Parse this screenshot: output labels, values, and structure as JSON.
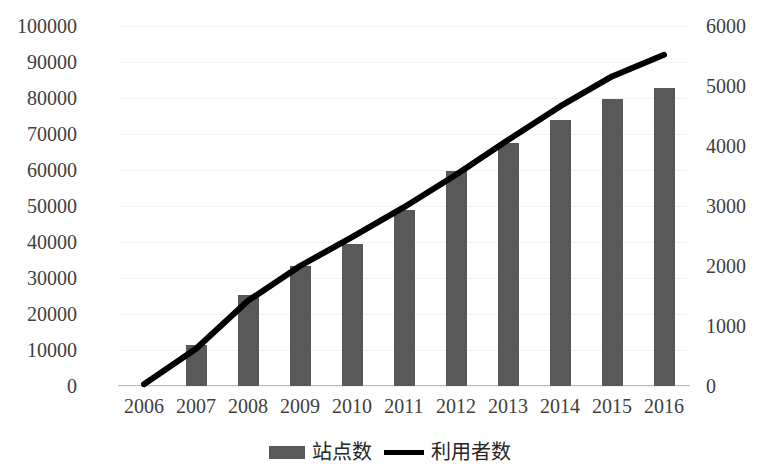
{
  "chart_data": {
    "type": "bar",
    "title": "",
    "subtitle": "",
    "xlabel": "",
    "ylabel": "",
    "grid": true,
    "legend_position": "bottom",
    "categories": [
      "2006",
      "2007",
      "2008",
      "2009",
      "2010",
      "2011",
      "2012",
      "2013",
      "2014",
      "2015",
      "2016"
    ],
    "axes": {
      "left": {
        "label": "",
        "min": 0,
        "max": 100000,
        "step": 10000,
        "ticks": [
          "0",
          "10000",
          "20000",
          "30000",
          "40000",
          "50000",
          "60000",
          "70000",
          "80000",
          "90000",
          "100000"
        ]
      },
      "right": {
        "label": "",
        "min": 0,
        "max": 6000,
        "step": 1000,
        "ticks": [
          "0",
          "1000",
          "2000",
          "3000",
          "4000",
          "5000",
          "6000"
        ]
      }
    },
    "series": [
      {
        "name": "站点数",
        "type": "bar",
        "axis": "left",
        "color": "#595959",
        "values": [
          0,
          11400,
          25300,
          33200,
          39500,
          48900,
          59600,
          67400,
          73900,
          79600,
          82900
        ]
      },
      {
        "name": "利用者数",
        "type": "line",
        "axis": "right",
        "color": "#000000",
        "values": [
          30,
          620,
          1420,
          2000,
          2480,
          2980,
          3520,
          4100,
          4660,
          5160,
          5520
        ]
      }
    ]
  },
  "legend": {
    "items": [
      {
        "label": "站点数",
        "marker": "bar-swatch",
        "color": "#595959"
      },
      {
        "label": "利用者数",
        "marker": "line-swatch",
        "color": "#000000"
      }
    ]
  }
}
